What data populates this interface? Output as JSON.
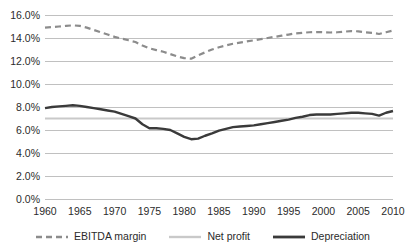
{
  "chart_data": {
    "type": "line",
    "title": "",
    "subtitle": "",
    "xlabel": "",
    "ylabel": "",
    "xlim": [
      1960,
      2010
    ],
    "ylim": [
      0.0,
      16.0
    ],
    "grid": true,
    "grid_axis": "y",
    "legend_position": "bottom",
    "x_ticks": [
      1960,
      1965,
      1970,
      1975,
      1980,
      1985,
      1990,
      1995,
      2000,
      2005,
      2010
    ],
    "x_tick_labels": [
      "1960",
      "1965",
      "1970",
      "1975",
      "1980",
      "1985",
      "1990",
      "1995",
      "2000",
      "2005",
      "2010"
    ],
    "y_ticks": [
      0.0,
      2.0,
      4.0,
      6.0,
      8.0,
      10.0,
      12.0,
      14.0,
      16.0
    ],
    "y_tick_labels": [
      "0.0%",
      "2.0%",
      "4.0%",
      "6.0%",
      "8.0%",
      "10.0%",
      "12.0%",
      "14.0%",
      "16.0%"
    ],
    "x": [
      1960,
      1961,
      1962,
      1963,
      1964,
      1965,
      1966,
      1967,
      1968,
      1969,
      1970,
      1971,
      1972,
      1973,
      1974,
      1975,
      1976,
      1977,
      1978,
      1979,
      1980,
      1981,
      1982,
      1983,
      1984,
      1985,
      1986,
      1987,
      1988,
      1989,
      1990,
      1991,
      1992,
      1993,
      1994,
      1995,
      1996,
      1997,
      1998,
      1999,
      2000,
      2001,
      2002,
      2003,
      2004,
      2005,
      2006,
      2007,
      2008,
      2009,
      2010
    ],
    "series": [
      {
        "name": "EBITDA margin",
        "color": "#8c8c8c",
        "style": "dashed",
        "width": 2.2,
        "values": [
          14.9,
          14.95,
          15.0,
          15.05,
          15.1,
          15.05,
          14.9,
          14.7,
          14.5,
          14.3,
          14.1,
          13.95,
          13.8,
          13.65,
          13.35,
          13.1,
          12.95,
          12.8,
          12.6,
          12.4,
          12.25,
          12.2,
          12.5,
          12.75,
          13.0,
          13.2,
          13.35,
          13.5,
          13.6,
          13.7,
          13.8,
          13.9,
          14.0,
          14.1,
          14.2,
          14.3,
          14.4,
          14.45,
          14.5,
          14.52,
          14.5,
          14.48,
          14.5,
          14.55,
          14.6,
          14.58,
          14.5,
          14.45,
          14.35,
          14.5,
          14.65
        ]
      },
      {
        "name": "Net profit",
        "color": "#c9c9c9",
        "style": "solid",
        "width": 2.0,
        "values": [
          7.0,
          7.0,
          7.0,
          7.0,
          7.0,
          7.0,
          7.0,
          7.0,
          7.0,
          7.0,
          7.0,
          7.0,
          7.0,
          7.0,
          7.0,
          7.0,
          7.0,
          7.0,
          7.0,
          7.0,
          7.0,
          7.0,
          7.0,
          7.0,
          7.0,
          7.0,
          7.0,
          7.0,
          7.0,
          7.0,
          7.0,
          7.0,
          7.0,
          7.0,
          7.0,
          7.0,
          7.0,
          7.0,
          7.0,
          7.0,
          7.0,
          7.0,
          7.0,
          7.0,
          7.0,
          7.0,
          7.0,
          7.0,
          7.0,
          7.0,
          7.0
        ]
      },
      {
        "name": "Depreciation",
        "color": "#3a3a3a",
        "style": "solid",
        "width": 2.4,
        "values": [
          7.9,
          8.0,
          8.05,
          8.1,
          8.15,
          8.1,
          8.0,
          7.9,
          7.8,
          7.7,
          7.6,
          7.4,
          7.2,
          7.0,
          6.5,
          6.15,
          6.15,
          6.1,
          6.0,
          5.7,
          5.4,
          5.2,
          5.25,
          5.5,
          5.7,
          5.95,
          6.1,
          6.25,
          6.3,
          6.35,
          6.4,
          6.5,
          6.6,
          6.7,
          6.8,
          6.9,
          7.05,
          7.15,
          7.3,
          7.35,
          7.35,
          7.35,
          7.4,
          7.45,
          7.5,
          7.5,
          7.45,
          7.4,
          7.25,
          7.5,
          7.65
        ]
      }
    ]
  },
  "legend": {
    "items": [
      {
        "label": "EBITDA margin"
      },
      {
        "label": "Net profit"
      },
      {
        "label": "Depreciation"
      }
    ]
  }
}
